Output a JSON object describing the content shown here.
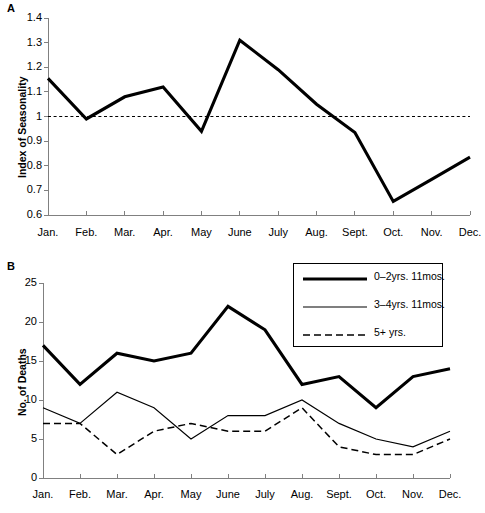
{
  "figure": {
    "panel_a_letter": "A",
    "panel_b_letter": "B"
  },
  "panel_a": {
    "ylabel": "Index of Seasonality",
    "ytick_labels": [
      "1.4",
      "1.3",
      "1.2",
      "1.1",
      "1",
      "0.9",
      "0.8",
      "0.7",
      "0.6"
    ],
    "xtick_labels": [
      "Jan.",
      "Feb.",
      "Mar.",
      "Apr.",
      "May",
      "June",
      "July",
      "Aug.",
      "Sept.",
      "Oct.",
      "Nov.",
      "Dec."
    ]
  },
  "panel_b": {
    "ylabel": "No. of Deaths",
    "ytick_labels": [
      "25",
      "20",
      "15",
      "10",
      "5",
      "0"
    ],
    "xtick_labels": [
      "Jan.",
      "Feb.",
      "Mar.",
      "Apr.",
      "May",
      "June",
      "July",
      "Aug.",
      "Sept.",
      "Oct.",
      "Nov.",
      "Dec."
    ],
    "legend": [
      {
        "label": "0–2yrs. 11mos.",
        "style": "thick"
      },
      {
        "label": "3–4yrs. 11mos.",
        "style": "thin"
      },
      {
        "label": "5+ yrs.",
        "style": "dashed"
      }
    ]
  },
  "chart_data": [
    {
      "type": "line",
      "panel": "A",
      "title": "",
      "xlabel": "",
      "ylabel": "Index of Seasonality",
      "categories": [
        "Jan.",
        "Feb.",
        "Mar.",
        "Apr.",
        "May",
        "June",
        "July",
        "Aug.",
        "Sept.",
        "Oct.",
        "Nov.",
        "Dec."
      ],
      "ylim": [
        0.6,
        1.4
      ],
      "yticks": [
        0.6,
        0.7,
        0.8,
        0.9,
        1.0,
        1.1,
        1.2,
        1.3,
        1.4
      ],
      "grid": false,
      "legend": "none",
      "reference_line": {
        "y": 1.0,
        "style": "dotted"
      },
      "series": [
        {
          "name": "Index of Seasonality",
          "style": "thick-solid",
          "values": [
            1.155,
            0.99,
            1.08,
            1.12,
            0.94,
            1.31,
            1.19,
            1.05,
            0.935,
            0.655,
            0.745,
            0.835
          ]
        }
      ]
    },
    {
      "type": "line",
      "panel": "B",
      "title": "",
      "xlabel": "",
      "ylabel": "No. of Deaths",
      "categories": [
        "Jan.",
        "Feb.",
        "Mar.",
        "Apr.",
        "May",
        "June",
        "July",
        "Aug.",
        "Sept.",
        "Oct.",
        "Nov.",
        "Dec."
      ],
      "ylim": [
        0,
        25
      ],
      "yticks": [
        0,
        5,
        10,
        15,
        20,
        25
      ],
      "grid": false,
      "legend": "top-right",
      "series": [
        {
          "name": "0–2yrs. 11mos.",
          "style": "thick-solid",
          "values": [
            17,
            12,
            16,
            15,
            16,
            22,
            19,
            12,
            13,
            9,
            13,
            14
          ]
        },
        {
          "name": "3–4yrs. 11mos.",
          "style": "thin-solid",
          "values": [
            9,
            7,
            11,
            9,
            5,
            8,
            8,
            10,
            7,
            5,
            4,
            6
          ]
        },
        {
          "name": "5+ yrs.",
          "style": "dashed",
          "values": [
            7,
            7,
            3,
            6,
            7,
            6,
            6,
            9,
            4,
            3,
            3,
            5
          ]
        }
      ]
    }
  ]
}
